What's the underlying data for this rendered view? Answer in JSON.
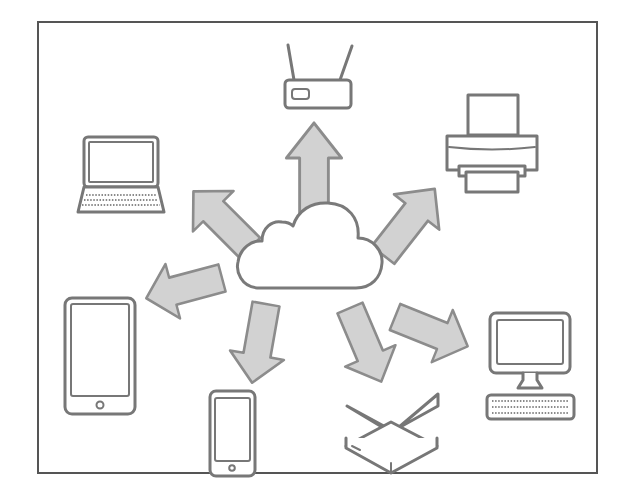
{
  "diagram": {
    "frame": {
      "x": 38,
      "y": 22,
      "width": 559,
      "height": 451,
      "border_color": "#555555"
    },
    "colors": {
      "arrow_fill": "#d2d2d2",
      "arrow_stroke": "#8c8c8c",
      "device_stroke": "#777777",
      "background": "#ffffff"
    },
    "center": {
      "name": "cloud",
      "icon": "cloud-icon"
    },
    "devices": [
      {
        "name": "router",
        "icon": "router-icon",
        "direction": "up"
      },
      {
        "name": "printer",
        "icon": "printer-icon",
        "direction": "up-right"
      },
      {
        "name": "desktop computer",
        "icon": "desktop-icon",
        "direction": "right"
      },
      {
        "name": "external hard drive",
        "icon": "hard-drive-icon",
        "direction": "down-right"
      },
      {
        "name": "smartphone",
        "icon": "smartphone-icon",
        "direction": "down-left"
      },
      {
        "name": "tablet",
        "icon": "tablet-icon",
        "direction": "left"
      },
      {
        "name": "laptop",
        "icon": "laptop-icon",
        "direction": "up-left"
      }
    ],
    "arrow_count": 7
  }
}
